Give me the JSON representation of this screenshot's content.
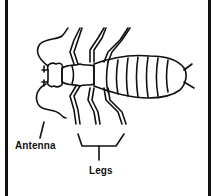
{
  "diagram": {
    "labels": {
      "antenna": "Antenna",
      "legs": "Legs"
    },
    "colors": {
      "line": "#111111",
      "background": "#ffffff"
    }
  }
}
